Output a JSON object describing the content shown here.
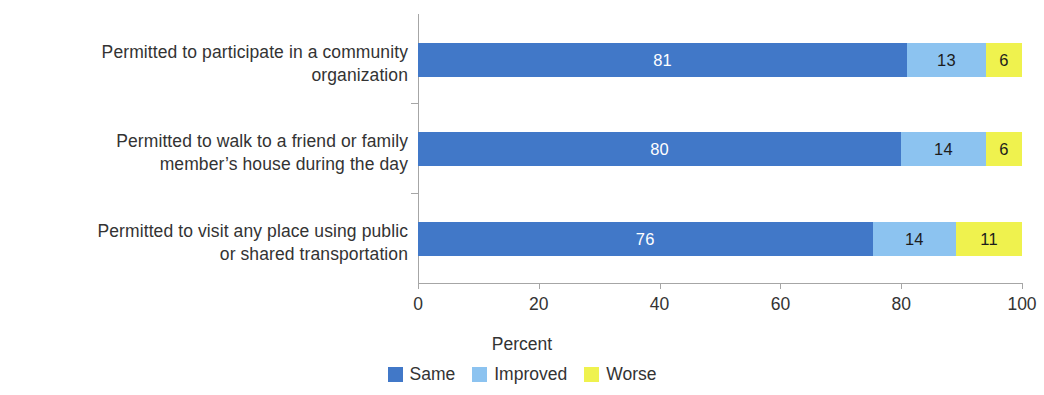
{
  "chart_data": {
    "type": "bar",
    "orientation": "horizontal",
    "stacked": true,
    "stack_mode": "percent",
    "title": "",
    "subtitle": "",
    "xlabel": "Percent",
    "ylabel": "",
    "xlim": [
      0,
      100
    ],
    "xticks": [
      0,
      20,
      40,
      60,
      80,
      100
    ],
    "xtick_labels": [
      "0",
      "20",
      "40",
      "60",
      "80",
      "100"
    ],
    "grid": false,
    "legend_position": "bottom",
    "categories": [
      "Permitted to participate in a community organization",
      "Permitted to walk to a friend or family member’s house during the day",
      "Permitted to visit any place using public or shared transportation"
    ],
    "category_lines": [
      [
        "Permitted to participate in a community",
        "organization"
      ],
      [
        "Permitted to walk to a friend or family",
        "member’s house during the day"
      ],
      [
        "Permitted to visit any place using public",
        "or shared transportation"
      ]
    ],
    "series": [
      {
        "name": "Same",
        "color": "#4178c8",
        "values": [
          81,
          80,
          76
        ],
        "labels": [
          "81",
          "80",
          "76"
        ]
      },
      {
        "name": "Improved",
        "color": "#8cc3f0",
        "values": [
          13,
          14,
          14
        ],
        "labels": [
          "13",
          "14",
          "14"
        ]
      },
      {
        "name": "Worse",
        "color": "#eff24e",
        "values": [
          6,
          6,
          11
        ],
        "labels": [
          "6",
          "6",
          "11"
        ]
      }
    ]
  },
  "axis": {
    "x_title": "Percent"
  },
  "legend": {
    "items": [
      {
        "label": "Same",
        "color": "#4178c8"
      },
      {
        "label": "Improved",
        "color": "#8cc3f0"
      },
      {
        "label": "Worse",
        "color": "#eff24e"
      }
    ]
  }
}
